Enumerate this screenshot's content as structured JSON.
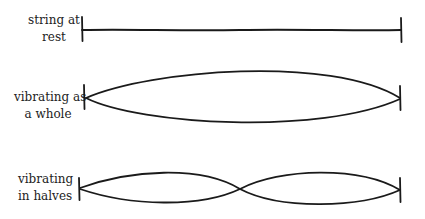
{
  "diagram": {
    "rows": [
      {
        "id": "rest",
        "label_line1": "string at",
        "label_line2": "rest"
      },
      {
        "id": "whole",
        "label_line1": "vibrating as",
        "label_line2": "a whole"
      },
      {
        "id": "halves",
        "label_line1": "vibrating",
        "label_line2": "in halves"
      }
    ],
    "stroke_color": "#1a1a1a",
    "background_color": "#ffffff"
  }
}
